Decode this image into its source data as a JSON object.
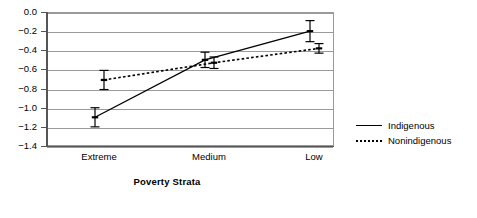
{
  "chart_data": {
    "type": "line",
    "title": "",
    "xlabel": "Poverty Strata",
    "ylabel": "",
    "categories": [
      "Extreme",
      "Medium",
      "Low"
    ],
    "ylim": [
      -1.4,
      0.0
    ],
    "ytick_labels": [
      "0.0",
      "−0.2",
      "−0.4",
      "−0.6",
      "−0.8",
      "−1.0",
      "−1.2",
      "−1.4"
    ],
    "ytick_values": [
      0.0,
      -0.2,
      -0.4,
      -0.6,
      -0.8,
      -1.0,
      -1.2,
      -1.4
    ],
    "grid": "horizontal",
    "legend_position": "right-outside",
    "series": [
      {
        "name": "Indigenous",
        "line_style": "solid",
        "values": [
          -1.1,
          -0.5,
          -0.2
        ],
        "errors": [
          0.1,
          0.08,
          0.11
        ],
        "error_low": [
          -1.2,
          -0.58,
          -0.31
        ],
        "error_high": [
          -1.0,
          -0.42,
          -0.09
        ]
      },
      {
        "name": "Nonindigenous",
        "line_style": "dotted",
        "values": [
          -0.71,
          -0.53,
          -0.38
        ],
        "errors": [
          0.1,
          0.06,
          0.05
        ],
        "error_low": [
          -0.81,
          -0.59,
          -0.43
        ],
        "error_high": [
          -0.61,
          -0.47,
          -0.33
        ]
      }
    ]
  },
  "legend": {
    "items": [
      {
        "label": "Indigenous",
        "style": "solid"
      },
      {
        "label": "Nonindigenous",
        "style": "dotted"
      }
    ]
  },
  "colors": {
    "line": "#000000",
    "grid": "#9a9a9a",
    "axis": "#555555",
    "background": "#ffffff"
  }
}
